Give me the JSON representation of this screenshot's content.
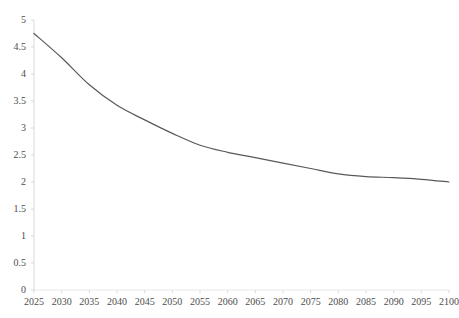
{
  "chart_data": {
    "type": "line",
    "title": "",
    "subtitle": "",
    "xlabel": "",
    "ylabel": "",
    "legend": [],
    "legend_position": "none",
    "grid": false,
    "xlim": [
      2025,
      2100
    ],
    "ylim": [
      0,
      5
    ],
    "x_tick_labels": [
      "2025",
      "2030",
      "2035",
      "2040",
      "2045",
      "2050",
      "2055",
      "2060",
      "2065",
      "2070",
      "2075",
      "2080",
      "2085",
      "2090",
      "2095",
      "2100"
    ],
    "y_tick_labels": [
      "0",
      "0.5",
      "1",
      "1.5",
      "2",
      "2.5",
      "3",
      "3.5",
      "4",
      "4.5",
      "5"
    ],
    "x": [
      2025,
      2030,
      2035,
      2040,
      2045,
      2050,
      2055,
      2060,
      2065,
      2070,
      2075,
      2080,
      2085,
      2090,
      2095,
      2100
    ],
    "values": [
      4.75,
      4.3,
      3.8,
      3.42,
      3.15,
      2.9,
      2.68,
      2.55,
      2.45,
      2.35,
      2.25,
      2.15,
      2.1,
      2.08,
      2.05,
      2.0
    ],
    "series": [
      {
        "name": "",
        "color": "#595959",
        "values": [
          4.75,
          4.3,
          3.8,
          3.42,
          3.15,
          2.9,
          2.68,
          2.55,
          2.45,
          2.35,
          2.25,
          2.15,
          2.1,
          2.08,
          2.05,
          2.0
        ]
      }
    ]
  },
  "axes": {
    "line_color": "#d9d9d9",
    "tick_color": "#d9d9d9",
    "label_color": "#4d4d4d"
  }
}
